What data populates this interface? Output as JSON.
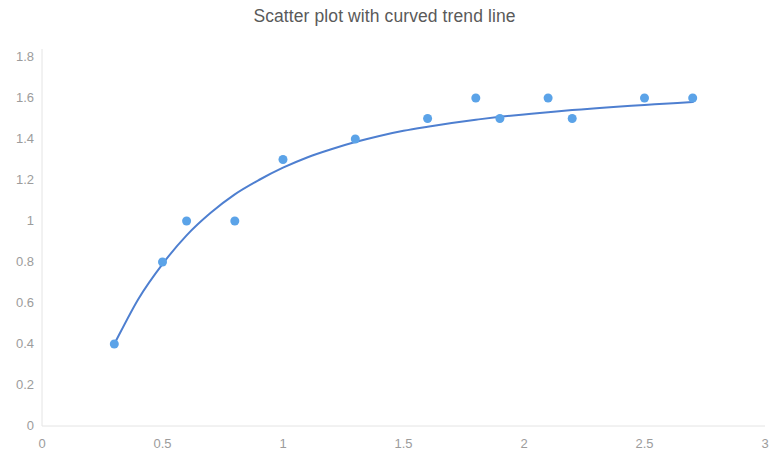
{
  "chart_data": {
    "type": "scatter",
    "title": "Scatter plot with curved trend line",
    "xlabel": "",
    "ylabel": "",
    "xlim": [
      0,
      3
    ],
    "ylim": [
      0,
      1.8
    ],
    "x_ticks": [
      0,
      0.5,
      1,
      1.5,
      2,
      2.5,
      3
    ],
    "x_tick_labels": [
      "0",
      "0.5",
      "1",
      "1.5",
      "2",
      "2.5",
      "3"
    ],
    "y_ticks": [
      0,
      0.2,
      0.4,
      0.6,
      0.8,
      1,
      1.2,
      1.4,
      1.6,
      1.8
    ],
    "y_tick_labels": [
      "0",
      "0.2",
      "0.4",
      "0.6",
      "0.8",
      "1",
      "1.2",
      "1.4",
      "1.6",
      "1.8"
    ],
    "grid": false,
    "legend": false,
    "legend_position": "none",
    "series": [
      {
        "name": "Data points",
        "type": "scatter",
        "marker": "circle",
        "marker_color": "#5BA3E8",
        "marker_size": 9,
        "x": [
          0.3,
          0.5,
          0.6,
          0.8,
          1.0,
          1.3,
          1.6,
          1.8,
          1.9,
          2.1,
          2.2,
          2.5,
          2.7
        ],
        "y": [
          0.4,
          0.8,
          1.0,
          1.0,
          1.3,
          1.4,
          1.5,
          1.6,
          1.5,
          1.6,
          1.5,
          1.6,
          1.6
        ]
      },
      {
        "name": "Curved trend line",
        "type": "line",
        "line_color": "#4E7FD0",
        "line_width": 2,
        "x": [
          0.3,
          0.4,
          0.5,
          0.6,
          0.7,
          0.8,
          0.9,
          1.0,
          1.1,
          1.2,
          1.3,
          1.4,
          1.5,
          1.6,
          1.7,
          1.8,
          1.9,
          2.0,
          2.1,
          2.2,
          2.3,
          2.4,
          2.5,
          2.6,
          2.7
        ],
        "y": [
          0.4,
          0.62,
          0.79,
          0.93,
          1.04,
          1.13,
          1.2,
          1.26,
          1.31,
          1.35,
          1.385,
          1.415,
          1.44,
          1.46,
          1.478,
          1.494,
          1.508,
          1.52,
          1.531,
          1.541,
          1.55,
          1.558,
          1.566,
          1.573,
          1.58
        ]
      }
    ]
  },
  "style": {
    "background_color": "#ffffff",
    "title_color": "#5a5a5a",
    "tick_label_color": "#9c9c9c",
    "axis_line_color": "#e4e4e4"
  }
}
